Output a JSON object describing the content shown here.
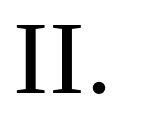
{
  "section": {
    "numeral": "II."
  }
}
